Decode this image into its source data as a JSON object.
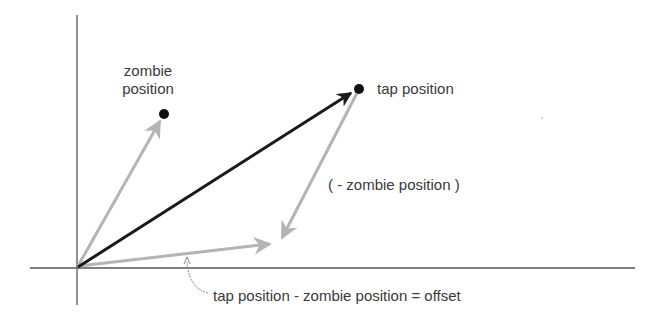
{
  "diagram": {
    "type": "vector-subtraction",
    "colors": {
      "axis": "#555555",
      "result_vector": "#1a1a1a",
      "component_vector": "#b4b4b4",
      "point": "#111111",
      "text": "#3a3a3a"
    },
    "origin": {
      "x": 77,
      "y": 268
    },
    "axes": {
      "y_axis": {
        "x": 77,
        "y1": 15,
        "y2": 305
      },
      "x_axis": {
        "y": 268,
        "x1": 30,
        "x2": 635
      }
    },
    "points": [
      {
        "id": "zombie",
        "x": 164,
        "y": 114
      },
      {
        "id": "tap",
        "x": 359,
        "y": 89
      }
    ],
    "labels": {
      "zombie_line1": "zombie",
      "zombie_line2": "position",
      "tap": "tap position",
      "negative_zombie": "( - zombie position )",
      "offset_equation": "tap position - zombie position = offset"
    },
    "vectors": [
      {
        "name": "zombie-position-vector",
        "from": "origin",
        "to": "zombie",
        "style": "gray"
      },
      {
        "name": "tap-position-vector",
        "from": "origin",
        "to": "tap",
        "style": "black"
      },
      {
        "name": "negative-zombie-vector",
        "from": "tap",
        "to": "offset-end",
        "style": "gray"
      },
      {
        "name": "offset-vector",
        "from": "origin",
        "to": "offset-end",
        "style": "gray"
      }
    ]
  }
}
